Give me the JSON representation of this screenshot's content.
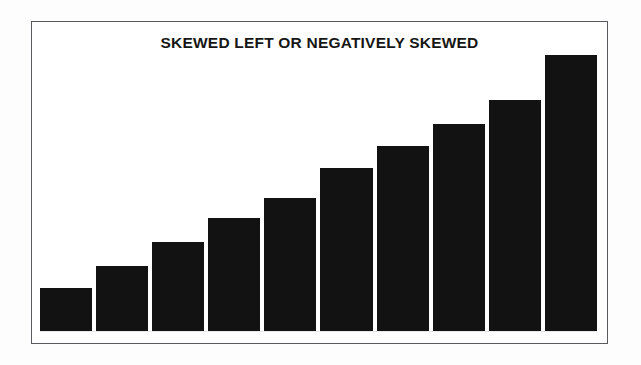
{
  "figure": {
    "title": "SKEWED LEFT OR NEGATIVELY SKEWED",
    "border_color": "#5a5a5e",
    "background_color": "#ffffff"
  },
  "chart_data": {
    "type": "bar",
    "title": "SKEWED LEFT OR NEGATIVELY SKEWED",
    "subtitle": "",
    "xlabel": "",
    "ylabel": "",
    "categories": [
      "1",
      "2",
      "3",
      "4",
      "5",
      "6",
      "7",
      "8",
      "9",
      "10"
    ],
    "values": [
      37,
      56,
      77,
      98,
      115,
      141,
      160,
      179,
      200,
      239
    ],
    "ylim": [
      0,
      250
    ],
    "xlim": [
      0,
      10
    ],
    "grid": false,
    "legend": false,
    "legend_position": "none",
    "bar_color": "#121212",
    "tick_labels_x": [],
    "tick_labels_y": [],
    "annotations": []
  }
}
